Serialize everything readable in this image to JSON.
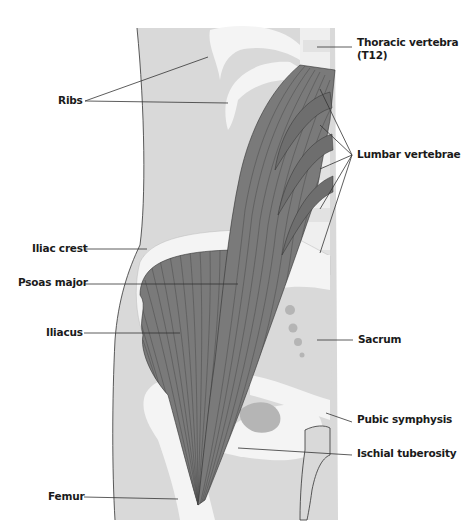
{
  "diagram": {
    "colors": {
      "background": "#ffffff",
      "tissue": "#d9d9d9",
      "bone": "#f4f4f4",
      "bone_dark": "#c4c4c4",
      "muscle": "#7a7a7a",
      "muscle_line": "#4a4a4a",
      "leader_line": "#333333",
      "label_text": "#1a1a1a"
    },
    "labels": [
      {
        "id": "thoracic-vertebra",
        "text": "Thoracic vertebra",
        "text2": "(T12)",
        "side": "right"
      },
      {
        "id": "ribs",
        "text": "Ribs",
        "side": "left"
      },
      {
        "id": "lumbar-vertebrae",
        "text": "Lumbar vertebrae",
        "side": "right"
      },
      {
        "id": "iliac-crest",
        "text": "Iliac crest",
        "side": "left"
      },
      {
        "id": "psoas-major",
        "text": "Psoas major",
        "side": "left"
      },
      {
        "id": "iliacus",
        "text": "Iliacus",
        "side": "left"
      },
      {
        "id": "sacrum",
        "text": "Sacrum",
        "side": "right"
      },
      {
        "id": "pubic-symphysis",
        "text": "Pubic symphysis",
        "side": "right"
      },
      {
        "id": "ischial-tuberosity",
        "text": "Ischial tuberosity",
        "side": "right"
      },
      {
        "id": "femur",
        "text": "Femur",
        "side": "left"
      }
    ]
  }
}
